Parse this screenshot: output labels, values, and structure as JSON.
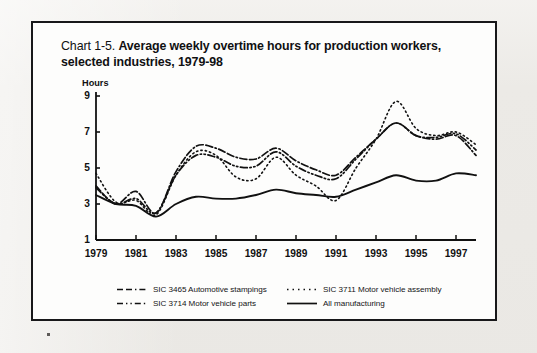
{
  "figure": {
    "title_prefix": "Chart 1-5.",
    "title_main": "Average weekly overtime hours for production workers, selected industries, 1979-98"
  },
  "legend": {
    "items": [
      {
        "label": "SIC 3465 Automotive stampings",
        "style": "dash-dash-dot"
      },
      {
        "label": "SIC 3711 Motor vehicle assembly",
        "style": "dotted"
      },
      {
        "label": "SIC 3714 Motor vehicle parts",
        "style": "dash-dot-dot"
      },
      {
        "label": "All manufacturing",
        "style": "solid"
      }
    ]
  },
  "chart_data": {
    "type": "line",
    "title": "Chart 1-5. Average weekly overtime hours for production workers, selected industries, 1979-98",
    "xlabel": "",
    "ylabel": "Hours",
    "ylim": [
      1,
      9
    ],
    "xlim": [
      1979,
      1998
    ],
    "yticks": [
      1,
      3,
      5,
      7,
      9
    ],
    "xticks": [
      1979,
      1981,
      1983,
      1985,
      1987,
      1989,
      1991,
      1993,
      1995,
      1997
    ],
    "grid": false,
    "legend_position": "below-axes",
    "x": [
      1979,
      1980,
      1981,
      1982,
      1983,
      1984,
      1985,
      1986,
      1987,
      1988,
      1989,
      1990,
      1991,
      1992,
      1993,
      1994,
      1995,
      1996,
      1997,
      1998
    ],
    "series": [
      {
        "name": "SIC 3465 Automotive stampings",
        "style": "dash-dash-dot",
        "values": [
          4.0,
          3.0,
          3.7,
          2.5,
          4.8,
          6.2,
          6.1,
          5.6,
          5.5,
          6.1,
          5.4,
          4.9,
          4.6,
          5.6,
          6.6,
          7.5,
          6.8,
          6.6,
          6.8,
          5.7
        ]
      },
      {
        "name": "SIC 3711 Motor vehicle assembly",
        "style": "dotted",
        "values": [
          4.7,
          3.1,
          3.2,
          2.4,
          4.6,
          5.9,
          5.7,
          4.5,
          4.4,
          5.6,
          4.6,
          4.0,
          3.2,
          5.0,
          6.6,
          8.7,
          7.2,
          6.8,
          7.0,
          6.3
        ]
      },
      {
        "name": "SIC 3714 Motor vehicle parts",
        "style": "dash-dot-dot",
        "values": [
          3.9,
          3.0,
          3.3,
          2.5,
          4.6,
          5.7,
          5.6,
          5.1,
          5.1,
          5.9,
          5.1,
          4.6,
          4.4,
          5.5,
          6.6,
          7.5,
          6.8,
          6.7,
          6.9,
          6.0
        ]
      },
      {
        "name": "All manufacturing",
        "style": "solid",
        "values": [
          3.5,
          3.0,
          2.9,
          2.3,
          3.0,
          3.4,
          3.3,
          3.3,
          3.5,
          3.8,
          3.6,
          3.5,
          3.4,
          3.8,
          4.2,
          4.6,
          4.3,
          4.3,
          4.7,
          4.6
        ]
      }
    ]
  }
}
